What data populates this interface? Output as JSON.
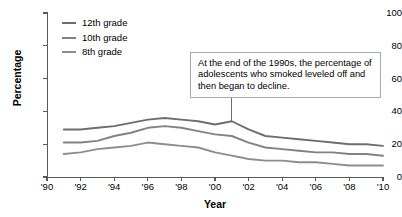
{
  "chart_data": {
    "type": "line",
    "title": "",
    "xlabel": "Year",
    "ylabel": "Percentage",
    "xlim": [
      1990,
      2010
    ],
    "ylim": [
      0,
      100
    ],
    "grid": false,
    "legend_position": "top-left",
    "x_tick_labels": [
      "'90",
      "'92",
      "'94",
      "'96",
      "'98",
      "'00",
      "'02",
      "'04",
      "'06",
      "'08",
      "'10"
    ],
    "x_tick_values": [
      1990,
      1992,
      1994,
      1996,
      1998,
      2000,
      2002,
      2004,
      2006,
      2008,
      2010
    ],
    "y_tick_labels": [
      "0",
      "20",
      "40",
      "60",
      "80",
      "100"
    ],
    "y_tick_values": [
      0,
      20,
      40,
      60,
      80,
      100
    ],
    "x": [
      1991,
      1992,
      1993,
      1994,
      1995,
      1996,
      1997,
      1998,
      1999,
      2000,
      2001,
      2002,
      2003,
      2004,
      2005,
      2006,
      2007,
      2008,
      2009,
      2010
    ],
    "series": [
      {
        "name": "12th grade",
        "color": "#6d6e71",
        "values": [
          29,
          29,
          30,
          31,
          33,
          35,
          36,
          35,
          34,
          32,
          34,
          29,
          25,
          24,
          23,
          22,
          21,
          20,
          20,
          19
        ]
      },
      {
        "name": "10th grade",
        "color": "#808285",
        "values": [
          21,
          21,
          22,
          25,
          27,
          30,
          31,
          30,
          28,
          26,
          25,
          21,
          18,
          17,
          16,
          15,
          15,
          14,
          14,
          13
        ]
      },
      {
        "name": "8th grade",
        "color": "#8b8d8f",
        "values": [
          14,
          15,
          17,
          18,
          19,
          21,
          20,
          19,
          18,
          15,
          13,
          11,
          10,
          10,
          9,
          9,
          8,
          7,
          7,
          7
        ]
      }
    ],
    "annotations": [
      {
        "text": "At the end of the 1990s, the percentage of adolescents who smoked leveled off and then began to decline.",
        "leader_target_year": 2001,
        "leader_target_value": 34
      }
    ]
  },
  "legend": {
    "items": [
      {
        "label": "12th grade",
        "color": "#6d6e71"
      },
      {
        "label": "10th grade",
        "color": "#808285"
      },
      {
        "label": "8th grade",
        "color": "#8b8d8f"
      }
    ]
  },
  "axes": {
    "y_title": "Percentage",
    "x_title": "Year"
  },
  "annotation": {
    "text": "At the end of the 1990s, the percentage of adolescents who smoked leveled off and then began to decline."
  },
  "colors": {
    "axis": "#58595b",
    "annotation_border": "#a6a8ab",
    "background": "#ffffff",
    "text": "#000000"
  }
}
